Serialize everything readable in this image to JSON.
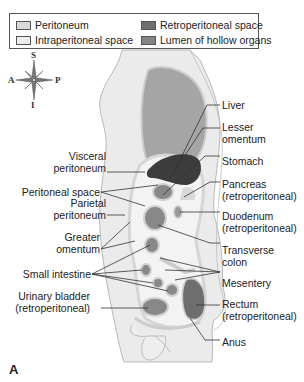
{
  "legend": {
    "items": [
      {
        "label": "Peritoneum",
        "color": "#d8d8d8"
      },
      {
        "label": "Retroperitoneal space",
        "color": "#6e6e6e"
      },
      {
        "label": "Intraperitoneal space",
        "color": "#ececec"
      },
      {
        "label": "Lumen of hollow organs",
        "color": "#858585"
      }
    ]
  },
  "compass": {
    "superior": "S",
    "inferior": "I",
    "anterior": "A",
    "posterior": "P"
  },
  "labels_left": [
    {
      "text": "Visceral\nperitoneum",
      "line1": "Visceral",
      "line2": "peritoneum"
    },
    {
      "text": "Peritoneal space"
    },
    {
      "line1": "Parietal",
      "line2": "peritoneum"
    },
    {
      "line1": "Greater",
      "line2": "omentum"
    },
    {
      "text": "Small intestine"
    },
    {
      "line1": "Urinary bladder",
      "line2": "(retroperitoneal)"
    }
  ],
  "labels_right": [
    {
      "text": "Liver"
    },
    {
      "line1": "Lesser",
      "line2": "omentum"
    },
    {
      "text": "Stomach"
    },
    {
      "line1": "Pancreas",
      "line2": "(retroperitoneal)"
    },
    {
      "line1": "Duodenum",
      "line2": "(retroperitoneal)"
    },
    {
      "line1": "Transverse",
      "line2": "colon"
    },
    {
      "text": "Mesentery"
    },
    {
      "line1": "Rectum",
      "line2": "(retroperitoneal)"
    },
    {
      "text": "Anus"
    }
  ],
  "panel_letter": "A",
  "colors": {
    "body_fill": "#e9e9e9",
    "peritoneum": "#d8d8d8",
    "intraperitoneal": "#f2f2f2",
    "retroperitoneal": "#6e6e6e",
    "lumen": "#858585",
    "liver": "#3a3a3a",
    "leader_line": "#333333"
  }
}
